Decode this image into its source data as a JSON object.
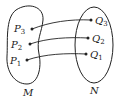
{
  "diagram": {
    "type": "mapping",
    "sets": [
      {
        "name": "M",
        "label": "M",
        "elements": [
          "P3",
          "P2",
          "P1"
        ]
      },
      {
        "name": "N",
        "label": "N",
        "elements": [
          "Q3",
          "Q2",
          "Q1"
        ]
      }
    ],
    "points": {
      "P3": {
        "letter": "P",
        "sub": "3"
      },
      "P2": {
        "letter": "P",
        "sub": "2"
      },
      "P1": {
        "letter": "P",
        "sub": "1"
      },
      "Q3": {
        "letter": "Q",
        "sub": "3"
      },
      "Q2": {
        "letter": "Q",
        "sub": "2"
      },
      "Q1": {
        "letter": "Q",
        "sub": "1"
      }
    },
    "mappings": [
      {
        "from": "P3",
        "to": "Q3"
      },
      {
        "from": "P2",
        "to": "Q2"
      },
      {
        "from": "P1",
        "to": "Q1"
      }
    ],
    "colors": {
      "stroke": "#222222",
      "background": "#ffffff"
    }
  }
}
